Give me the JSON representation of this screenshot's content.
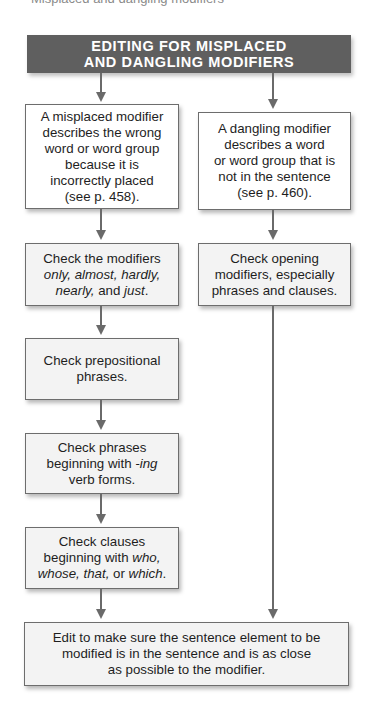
{
  "running_head": "Misplaced and dangling modifiers",
  "header": {
    "line1": "EDITING FOR MISPLACED",
    "line2": "AND DANGLING MODIFIERS",
    "color": "#5f5f5f"
  },
  "left_column": {
    "definition": {
      "lines": [
        "A misplaced modifier",
        "describes the wrong",
        "word or word group",
        "because it is",
        "incorrectly placed",
        "(see p. 458)."
      ]
    },
    "steps": [
      {
        "id": "check-limiting-modifiers",
        "line1": "Check the modifiers",
        "line2_italic": "only, almost, hardly,",
        "line3_italic_a": "nearly,",
        "line3_plain": " and ",
        "line3_italic_b": "just",
        "line3_end": "."
      },
      {
        "id": "check-prepositional",
        "line1": "Check prepositional",
        "line2": "phrases."
      },
      {
        "id": "check-ing-phrases",
        "line1": "Check phrases",
        "line2_plain": "beginning with ",
        "line2_italic": "-ing",
        "line3": "verb forms."
      },
      {
        "id": "check-clauses",
        "line1": "Check clauses",
        "line2_plain": "beginning with ",
        "line2_italic": "who,",
        "line3_italic_a": "whose, that,",
        "line3_plain": " or ",
        "line3_italic_b": "which",
        "line3_end": "."
      }
    ]
  },
  "right_column": {
    "definition": {
      "lines": [
        "A dangling modifier",
        "describes a word",
        "or word group that is",
        "not in the sentence",
        "(see p. 460)."
      ]
    },
    "steps": [
      {
        "id": "check-opening-modifiers",
        "line1": "Check opening",
        "line2": "modifiers, especially",
        "line3": "phrases and clauses."
      }
    ]
  },
  "final": {
    "lines": [
      "Edit to make sure the sentence element to be",
      "modified is in the sentence and is as close",
      "as possible to the modifier."
    ]
  },
  "colors": {
    "arrow": "#6a6a6a",
    "box_border": "#6d6d6d",
    "box_fill": "#f3f3f3"
  }
}
